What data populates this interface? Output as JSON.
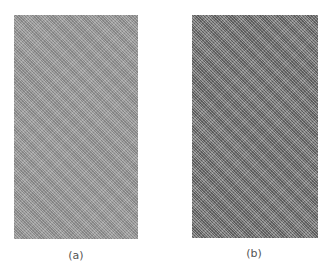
{
  "figure": {
    "panels": [
      {
        "id": "a",
        "caption": "(a)",
        "description": "light gray fine diagonal texture",
        "fill_color": "#9c9c9c"
      },
      {
        "id": "b",
        "caption": "(b)",
        "description": "darker gray fine diagonal texture",
        "fill_color": "#7c7c7c"
      }
    ]
  }
}
